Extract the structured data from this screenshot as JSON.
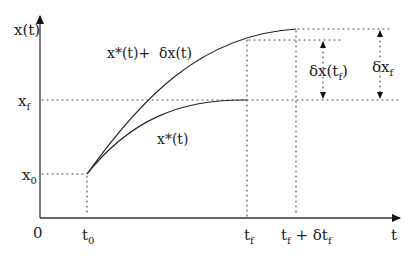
{
  "labels": {
    "y_axis": "x(t)",
    "x_axis": "t",
    "origin": "0",
    "x_f": "x",
    "x_f_sub": "f",
    "x_0": "x",
    "x_0_sub": "0",
    "t_0": "t",
    "t_0_sub": "0",
    "t_f": "t",
    "t_f_sub": "f",
    "t_f_plus": "t",
    "t_f_plus_sub": "f",
    "t_f_plus_rest": " + δt",
    "t_f_plus_rest_sub": "f",
    "optimal_curve": "x*(t)",
    "perturbed_curve": "x*(t)+  δx(t)",
    "delta_x_tf": "δx(t",
    "delta_x_tf_sub": "f",
    "delta_x_tf_close": ")",
    "delta_xf": "δx",
    "delta_xf_sub": "f"
  }
}
